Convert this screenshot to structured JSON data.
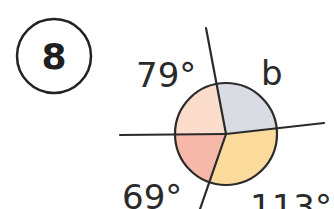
{
  "question": {
    "number": "8"
  },
  "diagram": {
    "center": {
      "x": 226,
      "y": 134
    },
    "radius": 51,
    "lines": {
      "top_end": {
        "x": 206,
        "y": 28
      },
      "left_end": {
        "x": 120,
        "y": 135
      },
      "right_end": {
        "x": 324,
        "y": 123
      },
      "bottom_end": {
        "x": 200,
        "y": 209
      }
    },
    "sector_colors": {
      "top_left": "#FCDCCB",
      "top_right": "#D9DDE3",
      "bottom_left": "#F6B9A9",
      "bottom_right": "#FADB9B"
    },
    "stroke_color": "#2a2a2a"
  },
  "labels": {
    "top_left": "79°",
    "top_right": "b",
    "bottom_left": "69°",
    "bottom_right": "113°"
  }
}
